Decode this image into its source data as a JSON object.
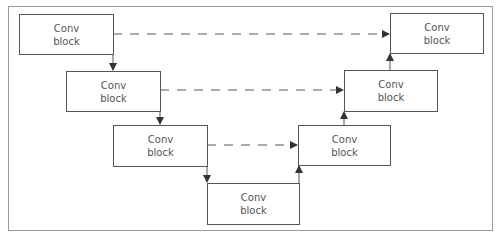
{
  "diagram": {
    "type": "U-Net encoder-decoder architecture",
    "blocks": [
      {
        "id": "enc1",
        "line1": "Conv",
        "line2": "block"
      },
      {
        "id": "enc2",
        "line1": "Conv",
        "line2": "block"
      },
      {
        "id": "enc3",
        "line1": "Conv",
        "line2": "block"
      },
      {
        "id": "bottleneck",
        "line1": "Conv",
        "line2": "block"
      },
      {
        "id": "dec3",
        "line1": "Conv",
        "line2": "block"
      },
      {
        "id": "dec2",
        "line1": "Conv",
        "line2": "block"
      },
      {
        "id": "dec1",
        "line1": "Conv",
        "line2": "block"
      }
    ],
    "edges": [
      {
        "from": "enc1",
        "to": "enc2",
        "style": "solid"
      },
      {
        "from": "enc2",
        "to": "enc3",
        "style": "solid"
      },
      {
        "from": "enc3",
        "to": "bottleneck",
        "style": "solid"
      },
      {
        "from": "bottleneck",
        "to": "dec3",
        "style": "solid"
      },
      {
        "from": "dec3",
        "to": "dec2",
        "style": "solid"
      },
      {
        "from": "dec2",
        "to": "dec1",
        "style": "solid"
      },
      {
        "from": "enc1",
        "to": "dec1",
        "style": "dashed"
      },
      {
        "from": "enc2",
        "to": "dec2",
        "style": "dashed"
      },
      {
        "from": "enc3",
        "to": "dec3",
        "style": "dashed"
      }
    ],
    "colors": {
      "stroke": "#555555",
      "frame": "#9a9a9a",
      "text": "#555555"
    }
  }
}
